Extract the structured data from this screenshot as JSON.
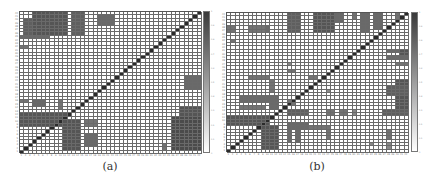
{
  "chart_data": [
    {
      "type": "heatmap",
      "title": "",
      "caption": "(a)",
      "n": 42,
      "origin": "bottom-left diagonal (row 0 = top)",
      "xlabel": "",
      "ylabel": "",
      "x_ticks": [
        "1",
        "2",
        "3",
        "4",
        "5",
        "6",
        "7",
        "8",
        "9",
        "10",
        "11",
        "12",
        "13",
        "14",
        "15",
        "16",
        "17",
        "18",
        "19",
        "20",
        "21",
        "22",
        "23",
        "24",
        "25",
        "26",
        "27",
        "28",
        "29",
        "30",
        "31",
        "32",
        "33",
        "34",
        "35",
        "36",
        "37",
        "38",
        "39",
        "40",
        "41",
        "42"
      ],
      "colorbar": {
        "min": 0,
        "max": 1,
        "ticks": [
          "0",
          "0.1",
          "0.2",
          "0.3",
          "0.4",
          "0.5",
          "0.6",
          "0.7",
          "0.8",
          "0.9",
          "1"
        ]
      },
      "blocks": [
        {
          "r0": 0,
          "r1": 6,
          "c0": 3,
          "c1": 10,
          "v": 0.85
        },
        {
          "r0": 2,
          "r1": 6,
          "c0": 1,
          "c1": 2,
          "v": 0.8
        },
        {
          "r0": 0,
          "r1": 6,
          "c0": 12,
          "c1": 14,
          "v": 0.8
        },
        {
          "r0": 1,
          "r1": 3,
          "c0": 18,
          "c1": 21,
          "v": 0.75
        },
        {
          "r0": 7,
          "r1": 7,
          "c0": 0,
          "c1": 6,
          "v": 0.75
        },
        {
          "r0": 10,
          "r1": 10,
          "c0": 0,
          "c1": 1,
          "v": 0.7
        },
        {
          "r0": 26,
          "r1": 26,
          "c0": 0,
          "c1": 1,
          "v": 0.7
        },
        {
          "r0": 26,
          "r1": 27,
          "c0": 3,
          "c1": 5,
          "v": 0.75
        },
        {
          "r0": 26,
          "r1": 28,
          "c0": 9,
          "c1": 9,
          "v": 0.7
        },
        {
          "r0": 30,
          "r1": 33,
          "c0": 0,
          "c1": 10,
          "v": 0.85
        },
        {
          "r0": 32,
          "r1": 40,
          "c0": 10,
          "c1": 13,
          "v": 0.85
        },
        {
          "r0": 32,
          "r1": 33,
          "c0": 15,
          "c1": 17,
          "v": 0.7
        },
        {
          "r0": 36,
          "r1": 39,
          "c0": 15,
          "c1": 17,
          "v": 0.75
        },
        {
          "r0": 19,
          "r1": 22,
          "c0": 38,
          "c1": 41,
          "v": 0.75
        },
        {
          "r0": 28,
          "r1": 30,
          "c0": 37,
          "c1": 41,
          "v": 0.85
        },
        {
          "r0": 31,
          "r1": 40,
          "c0": 35,
          "c1": 41,
          "v": 0.9
        },
        {
          "r0": 39,
          "r1": 40,
          "c0": 33,
          "c1": 33,
          "v": 0.7
        }
      ]
    },
    {
      "type": "heatmap",
      "title": "",
      "caption": "(b)",
      "n": 42,
      "origin": "bottom-left diagonal (row 0 = top)",
      "xlabel": "",
      "ylabel": "",
      "x_ticks": [
        "1",
        "2",
        "3",
        "4",
        "5",
        "6",
        "7",
        "8",
        "9",
        "10",
        "11",
        "12",
        "13",
        "14",
        "15",
        "16",
        "17",
        "18",
        "19",
        "20",
        "21",
        "22",
        "23",
        "24",
        "25",
        "26",
        "27",
        "28",
        "29",
        "30",
        "31",
        "32",
        "33",
        "34",
        "35",
        "36",
        "37",
        "38",
        "39",
        "40",
        "41",
        "42"
      ],
      "colorbar": {
        "min": 0,
        "max": 1,
        "ticks": [
          "0",
          "0.1",
          "0.2",
          "0.3",
          "0.4",
          "0.5",
          "0.6",
          "0.7",
          "0.8",
          "0.9",
          "1"
        ]
      },
      "blocks": [
        {
          "r0": 0,
          "r1": 5,
          "c0": 14,
          "c1": 16,
          "v": 0.8
        },
        {
          "r0": 0,
          "r1": 5,
          "c0": 20,
          "c1": 24,
          "v": 0.85
        },
        {
          "r0": 0,
          "r1": 2,
          "c0": 25,
          "c1": 26,
          "v": 0.75
        },
        {
          "r0": 0,
          "r1": 1,
          "c0": 29,
          "c1": 29,
          "v": 0.7
        },
        {
          "r0": 0,
          "r1": 5,
          "c0": 31,
          "c1": 32,
          "v": 0.75
        },
        {
          "r0": 0,
          "r1": 4,
          "c0": 34,
          "c1": 35,
          "v": 0.75
        },
        {
          "r0": 0,
          "r1": 1,
          "c0": 39,
          "c1": 39,
          "v": 0.7
        },
        {
          "r0": 4,
          "r1": 5,
          "c0": 0,
          "c1": 1,
          "v": 0.7
        },
        {
          "r0": 4,
          "r1": 5,
          "c0": 5,
          "c1": 8,
          "v": 0.7
        },
        {
          "r0": 4,
          "r1": 5,
          "c0": 9,
          "c1": 9,
          "v": 0.75
        },
        {
          "r0": 8,
          "r1": 8,
          "c0": 1,
          "c1": 1,
          "v": 0.7
        },
        {
          "r0": 11,
          "r1": 11,
          "c0": 37,
          "c1": 41,
          "v": 0.75
        },
        {
          "r0": 11,
          "r1": 13,
          "c0": 40,
          "c1": 41,
          "v": 0.85
        },
        {
          "r0": 13,
          "r1": 13,
          "c0": 37,
          "c1": 41,
          "v": 0.75
        },
        {
          "r0": 15,
          "r1": 15,
          "c0": 39,
          "c1": 41,
          "v": 0.7
        },
        {
          "r0": 15,
          "r1": 15,
          "c0": 14,
          "c1": 14,
          "v": 0.6
        },
        {
          "r0": 17,
          "r1": 17,
          "c0": 14,
          "c1": 15,
          "v": 0.7
        },
        {
          "r0": 19,
          "r1": 19,
          "c0": 5,
          "c1": 9,
          "v": 0.7
        },
        {
          "r0": 19,
          "r1": 19,
          "c0": 19,
          "c1": 20,
          "v": 0.7
        },
        {
          "r0": 20,
          "r1": 23,
          "c0": 10,
          "c1": 10,
          "v": 0.7
        },
        {
          "r0": 20,
          "r1": 28,
          "c0": 39,
          "c1": 41,
          "v": 0.85
        },
        {
          "r0": 22,
          "r1": 24,
          "c0": 37,
          "c1": 41,
          "v": 0.8
        },
        {
          "r0": 23,
          "r1": 23,
          "c0": 23,
          "c1": 23,
          "v": 0.6
        },
        {
          "r0": 25,
          "r1": 26,
          "c0": 3,
          "c1": 9,
          "v": 0.75
        },
        {
          "r0": 25,
          "r1": 28,
          "c0": 10,
          "c1": 11,
          "v": 0.75
        },
        {
          "r0": 26,
          "r1": 27,
          "c0": 14,
          "c1": 15,
          "v": 0.7
        },
        {
          "r0": 28,
          "r1": 28,
          "c0": 3,
          "c1": 8,
          "v": 0.7
        },
        {
          "r0": 29,
          "r1": 30,
          "c0": 14,
          "c1": 18,
          "v": 0.8
        },
        {
          "r0": 29,
          "r1": 30,
          "c0": 23,
          "c1": 24,
          "v": 0.7
        },
        {
          "r0": 29,
          "r1": 30,
          "c0": 26,
          "c1": 27,
          "v": 0.7
        },
        {
          "r0": 29,
          "r1": 30,
          "c0": 29,
          "c1": 29,
          "v": 0.6
        },
        {
          "r0": 29,
          "r1": 30,
          "c0": 36,
          "c1": 41,
          "v": 0.8
        },
        {
          "r0": 31,
          "r1": 33,
          "c0": 0,
          "c1": 9,
          "v": 0.85
        },
        {
          "r0": 33,
          "r1": 34,
          "c0": 14,
          "c1": 18,
          "v": 0.75
        },
        {
          "r0": 34,
          "r1": 34,
          "c0": 19,
          "c1": 23,
          "v": 0.7
        },
        {
          "r0": 34,
          "r1": 40,
          "c0": 8,
          "c1": 11,
          "v": 0.85
        },
        {
          "r0": 35,
          "r1": 38,
          "c0": 14,
          "c1": 14,
          "v": 0.75
        },
        {
          "r0": 35,
          "r1": 38,
          "c0": 16,
          "c1": 16,
          "v": 0.75
        },
        {
          "r0": 35,
          "r1": 37,
          "c0": 23,
          "c1": 23,
          "v": 0.7
        },
        {
          "r0": 35,
          "r1": 37,
          "c0": 37,
          "c1": 37,
          "v": 0.7
        },
        {
          "r0": 39,
          "r1": 39,
          "c0": 33,
          "c1": 33,
          "v": 0.6
        },
        {
          "r0": 39,
          "r1": 40,
          "c0": 37,
          "c1": 37,
          "v": 0.6
        }
      ]
    }
  ],
  "panels": [
    {
      "caption": "(a)"
    },
    {
      "caption": "(b)"
    }
  ],
  "colors": {
    "dark": "#3a3a3a",
    "diagonal": "#2a2a2a",
    "grid": "#6a6a6a",
    "background": "#ffffff"
  }
}
